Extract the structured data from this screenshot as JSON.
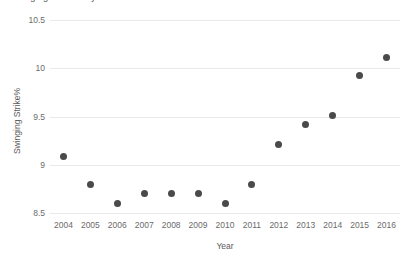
{
  "chart_data": {
    "type": "scatter",
    "title": "Swinging Strike% by Year",
    "xlabel": "Year",
    "ylabel": "Swinging Strike%",
    "categories": [
      2004,
      2005,
      2006,
      2007,
      2008,
      2009,
      2010,
      2011,
      2012,
      2013,
      2014,
      2015,
      2016
    ],
    "values": [
      9.09,
      8.8,
      8.6,
      8.7,
      8.7,
      8.7,
      8.6,
      8.8,
      9.21,
      9.42,
      9.51,
      9.92,
      10.11
    ],
    "x_tick_labels": [
      "2004",
      "2005",
      "2006",
      "2007",
      "2008",
      "2009",
      "2010",
      "2011",
      "2012",
      "2013",
      "2014",
      "2015",
      "2016"
    ],
    "y_tick_labels": [
      "10.5",
      "10",
      "9.5",
      "9",
      "8.5"
    ],
    "y_tick_values": [
      10.5,
      10,
      9.5,
      9,
      8.5
    ],
    "xlim": [
      2003.5,
      2016.5
    ],
    "ylim": [
      8.5,
      10.5
    ],
    "grid": true,
    "grid_axis": "y",
    "legend": "none",
    "marker_color": "#4a4a4a",
    "gridline_color": "#e9e9e9",
    "tick_label_color": "#6b6b6b",
    "axis_label_color": "#5a5a5a",
    "background_color": "#ffffff"
  }
}
